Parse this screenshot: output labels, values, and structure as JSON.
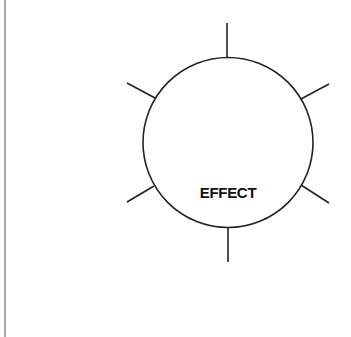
{
  "diagram": {
    "center_label": "EFFECT",
    "stroke_color": "#222222",
    "border_color": "#a9a9a9",
    "circle": {
      "cx": 228,
      "cy": 142.5,
      "r": 85
    },
    "spokes": [
      {
        "name": "top",
        "x1": 227,
        "y1": 23,
        "x2": 227,
        "y2": 57
      },
      {
        "name": "upper-right",
        "x1": 301,
        "y1": 99,
        "x2": 329,
        "y2": 84
      },
      {
        "name": "lower-right",
        "x1": 301,
        "y1": 185,
        "x2": 329,
        "y2": 203
      },
      {
        "name": "bottom",
        "x1": 228,
        "y1": 228,
        "x2": 228,
        "y2": 262
      },
      {
        "name": "lower-left",
        "x1": 154,
        "y1": 186,
        "x2": 127,
        "y2": 202
      },
      {
        "name": "upper-left",
        "x1": 155,
        "y1": 98,
        "x2": 127,
        "y2": 83
      }
    ]
  }
}
